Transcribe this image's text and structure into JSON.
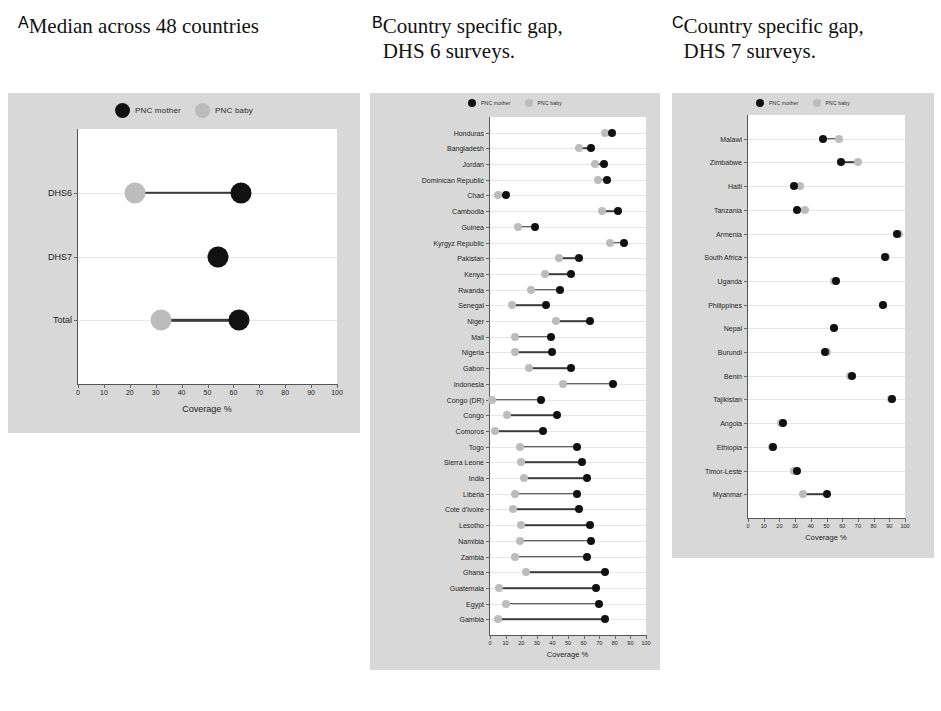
{
  "legend": {
    "mother_label": "PNC mother",
    "baby_label": "PNC baby",
    "mother_color": "#111111",
    "baby_color": "#bcbcbc"
  },
  "panels": {
    "a": {
      "letter": "A",
      "title": "Median across 48 countries"
    },
    "b": {
      "letter": "B",
      "title": "Country specific gap,\nDHS 6 surveys."
    },
    "c": {
      "letter": "C",
      "title": "Country specific gap,\nDHS 7 surveys."
    }
  },
  "chart_data": [
    {
      "type": "scatter",
      "panel": "A",
      "title": "Median across 48 countries",
      "xlabel": "Coverage %",
      "ylabel": "",
      "xlim": [
        0,
        100
      ],
      "xticks": [
        0,
        10,
        20,
        30,
        40,
        50,
        60,
        70,
        80,
        90,
        100
      ],
      "grid": true,
      "legend_position": "top",
      "categories": [
        "DHS6",
        "DHS7",
        "Total"
      ],
      "series": [
        {
          "name": "PNC mother",
          "values": [
            63,
            54,
            62
          ]
        },
        {
          "name": "PNC baby",
          "values": [
            22,
            54,
            32
          ]
        }
      ]
    },
    {
      "type": "scatter",
      "panel": "B",
      "title": "Country specific gap, DHS 6 surveys.",
      "xlabel": "Coverage %",
      "ylabel": "",
      "xlim": [
        0,
        100
      ],
      "xticks": [
        0,
        10,
        20,
        30,
        40,
        50,
        60,
        70,
        80,
        90,
        100
      ],
      "grid": true,
      "legend_position": "top",
      "categories": [
        "Honduras",
        "Bangladesh",
        "Jordan",
        "Dominican Republic",
        "Chad",
        "Cambodia",
        "Guinea",
        "Kyrgyz Republic",
        "Pakistan",
        "Kenya",
        "Rwanda",
        "Senegal",
        "Niger",
        "Mali",
        "Nigeria",
        "Gabon",
        "Indonesia",
        "Congo (DR)",
        "Congo",
        "Comoros",
        "Togo",
        "Sierra Leone",
        "India",
        "Liberia",
        "Cote d'Ivoire",
        "Lesotho",
        "Namibia",
        "Zambia",
        "Ghana",
        "Guatemala",
        "Egypt",
        "Gambia"
      ],
      "series": [
        {
          "name": "PNC mother",
          "values": [
            78,
            65,
            73,
            75,
            10,
            82,
            29,
            86,
            57,
            52,
            45,
            36,
            64,
            39,
            40,
            52,
            79,
            33,
            43,
            34,
            56,
            59,
            62,
            56,
            57,
            64,
            65,
            62,
            74,
            68,
            70,
            74
          ]
        },
        {
          "name": "PNC baby",
          "values": [
            74,
            57,
            67,
            69,
            5,
            72,
            18,
            77,
            44,
            35,
            26,
            14,
            42,
            16,
            16,
            25,
            47,
            1,
            11,
            3,
            19,
            20,
            22,
            16,
            15,
            20,
            19,
            16,
            23,
            6,
            10,
            5
          ]
        }
      ]
    },
    {
      "type": "scatter",
      "panel": "C",
      "title": "Country specific gap, DHS 7 surveys.",
      "xlabel": "Coverage %",
      "ylabel": "",
      "xlim": [
        0,
        100
      ],
      "xticks": [
        0,
        10,
        20,
        30,
        40,
        50,
        60,
        70,
        80,
        90,
        100
      ],
      "grid": true,
      "legend_position": "top",
      "categories": [
        "Malawi",
        "Zimbabwe",
        "Haiti",
        "Tanzania",
        "Armenia",
        "South Africa",
        "Uganda",
        "Philippines",
        "Nepal",
        "Burundi",
        "Benin",
        "Tajikistan",
        "Angola",
        "Ethiopia",
        "Timor-Leste",
        "Myanmar"
      ],
      "series": [
        {
          "name": "PNC mother",
          "values": [
            48,
            59,
            29,
            31,
            95,
            87,
            56,
            86,
            55,
            49,
            66,
            92,
            22,
            16,
            31,
            50
          ]
        },
        {
          "name": "PNC baby",
          "values": [
            58,
            70,
            33,
            36,
            96,
            88,
            55,
            86,
            55,
            50,
            65,
            91,
            21,
            15,
            29,
            35
          ]
        }
      ]
    }
  ]
}
